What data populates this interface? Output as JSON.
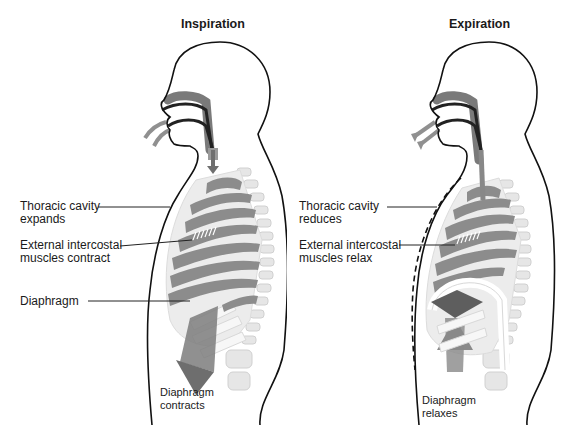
{
  "panels": [
    {
      "id": "inspiration",
      "title": "Inspiration",
      "labels": {
        "thoracic_line1": "Thoracic cavity",
        "thoracic_line2": "expands",
        "intercostal_line1": "External intercostal",
        "intercostal_line2": "muscles  contract",
        "diaphragm": "Diaphragm",
        "diaphragm_action_line1": "Diaphragm",
        "diaphragm_action_line2": "contracts"
      }
    },
    {
      "id": "expiration",
      "title": "Expiration",
      "labels": {
        "thoracic_line1": "Thoracic cavity",
        "thoracic_line2": "reduces",
        "intercostal_line1": "External intercostal",
        "intercostal_line2": "muscles  relax",
        "diaphragm_action_line1": "Diaphragm",
        "diaphragm_action_line2": "relaxes"
      }
    }
  ],
  "colors": {
    "outline": "#111111",
    "airway": "#7a7a7a",
    "airway_dark": "#222222",
    "rib_fill": "#8c8c8c",
    "bone": "#e4e4e4",
    "bone_edge": "#cfcfcf",
    "diaphragm_arrow": "#6e6e6e"
  }
}
